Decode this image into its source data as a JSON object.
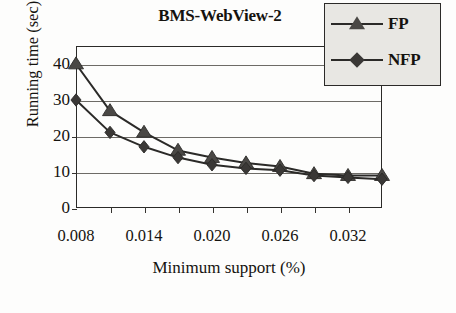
{
  "chart_data": {
    "type": "line",
    "title": "BMS-WebView-2",
    "xlabel": "Minimum support (%)",
    "ylabel": "Running time (sec)",
    "x": [
      0.008,
      0.011,
      0.014,
      0.017,
      0.02,
      0.023,
      0.026,
      0.029,
      0.032,
      0.035
    ],
    "x_tick_labels": [
      "0.008",
      "0.014",
      "0.020",
      "0.026",
      "0.032"
    ],
    "x_tick_label_indices": [
      0,
      2,
      4,
      6,
      8
    ],
    "y_ticks": [
      0,
      10,
      20,
      30,
      40
    ],
    "y_tick_labels": [
      "0",
      "10",
      "20",
      "30",
      "40"
    ],
    "ylim": [
      0,
      45
    ],
    "grid": "horizontal",
    "legend_position": "top-right",
    "series": [
      {
        "name": "FP",
        "marker": "triangle",
        "color": "#4a4845",
        "values": [
          40,
          27,
          21,
          16,
          14,
          12.5,
          11.5,
          9.5,
          9,
          9
        ]
      },
      {
        "name": "NFP",
        "marker": "diamond",
        "color": "#3a3836",
        "values": [
          30,
          21,
          17,
          14,
          12,
          11,
          10.5,
          9,
          8.5,
          8
        ]
      }
    ]
  },
  "legend": {
    "items": [
      {
        "label": "FP"
      },
      {
        "label": "NFP"
      }
    ]
  },
  "colors": {
    "axis": "#2b2a28",
    "grid": "#6d6b66",
    "legend_bg": "#e8e7e3",
    "text": "#15130f"
  }
}
